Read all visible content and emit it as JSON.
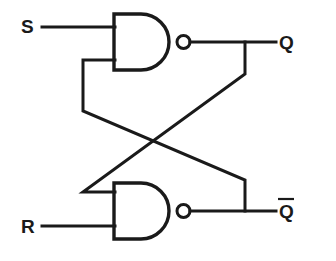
{
  "diagram": {
    "type": "logic-circuit-schematic",
    "background_color": "#ffffff",
    "line_color": "#1a1a1a",
    "labels": {
      "set_input": "S",
      "reset_input": "R",
      "q_output": "Q",
      "q_bar_output": "Q"
    },
    "gates": [
      {
        "id": "nand-top",
        "name": "NAND gate 1",
        "symbol": "NAND",
        "inputs": [
          "S",
          "Q-bar feedback"
        ],
        "output": "Q"
      },
      {
        "id": "nand-bottom",
        "name": "NAND gate 2",
        "symbol": "NAND",
        "inputs": [
          "Q feedback",
          "R"
        ],
        "output": "Q-bar"
      }
    ],
    "nets": [
      "S to NAND1 input A",
      "R to NAND2 input B",
      "NAND1 output to Q and cross-coupled to NAND2 input A",
      "NAND2 output to Q-bar and cross-coupled to NAND1 input B"
    ]
  },
  "geometry": {
    "gate_top": {
      "x": 114,
      "y": 14,
      "width": 54,
      "height": 56
    },
    "gate_bottom": {
      "x": 114,
      "y": 183,
      "width": 54,
      "height": 56
    },
    "bubble_radius": 6.5,
    "bubble_top": {
      "cx": 183.5,
      "cy": 42
    },
    "bubble_bottom": {
      "cx": 183.5,
      "cy": 211
    }
  }
}
